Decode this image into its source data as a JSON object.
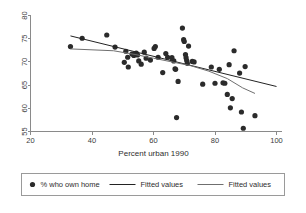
{
  "chart_data": {
    "type": "scatter",
    "title": "",
    "xlabel": "Percent urban 1990",
    "ylabel": "",
    "xlim": [
      20,
      100
    ],
    "ylim": [
      55,
      80
    ],
    "xticks": [
      20,
      40,
      60,
      80,
      100
    ],
    "yticks": [
      55,
      60,
      65,
      70,
      75,
      80
    ],
    "grid": false,
    "legend_position": "bottom",
    "series": [
      {
        "name": "% who own home",
        "type": "scatter",
        "marker": "filled-circle",
        "color": "#2b2b2b",
        "points": [
          [
            33.0,
            73.3
          ],
          [
            36.8,
            75.1
          ],
          [
            44.8,
            75.8
          ],
          [
            47.5,
            73.2
          ],
          [
            50.5,
            69.9
          ],
          [
            51.0,
            72.3
          ],
          [
            51.6,
            71.0
          ],
          [
            51.8,
            68.9
          ],
          [
            53.0,
            71.7
          ],
          [
            53.6,
            71.4
          ],
          [
            54.0,
            71.8
          ],
          [
            54.4,
            71.9
          ],
          [
            54.8,
            71.5
          ],
          [
            55.2,
            70.2
          ],
          [
            56.0,
            69.5
          ],
          [
            57.0,
            72.1
          ],
          [
            57.6,
            70.8
          ],
          [
            59.0,
            70.4
          ],
          [
            60.2,
            72.9
          ],
          [
            60.6,
            73.3
          ],
          [
            61.5,
            71.0
          ],
          [
            63.0,
            67.7
          ],
          [
            64.0,
            71.8
          ],
          [
            64.6,
            71.0
          ],
          [
            66.0,
            70.9
          ],
          [
            66.6,
            70.2
          ],
          [
            67.0,
            68.5
          ],
          [
            67.2,
            68.4
          ],
          [
            67.5,
            58.0
          ],
          [
            68.0,
            65.8
          ],
          [
            69.4,
            77.3
          ],
          [
            69.8,
            74.8
          ],
          [
            70.0,
            74.4
          ],
          [
            70.4,
            71.6
          ],
          [
            70.6,
            70.9
          ],
          [
            70.8,
            70.3
          ],
          [
            71.0,
            69.7
          ],
          [
            71.4,
            73.4
          ],
          [
            72.6,
            70.1
          ],
          [
            73.2,
            70.0
          ],
          [
            76.0,
            65.2
          ],
          [
            78.8,
            68.9
          ],
          [
            80.0,
            65.4
          ],
          [
            81.4,
            68.4
          ],
          [
            82.6,
            65.5
          ],
          [
            83.2,
            65.4
          ],
          [
            84.0,
            63.0
          ],
          [
            84.6,
            69.4
          ],
          [
            85.0,
            60.1
          ],
          [
            85.6,
            62.1
          ],
          [
            86.2,
            72.4
          ],
          [
            88.0,
            67.6
          ],
          [
            88.6,
            59.2
          ],
          [
            89.2,
            55.7
          ],
          [
            89.8,
            69.0
          ],
          [
            93.0,
            58.4
          ]
        ]
      },
      {
        "name": "Fitted values",
        "type": "line",
        "style": "linear",
        "color": "#232323",
        "points": [
          [
            33.0,
            75.6
          ],
          [
            100.0,
            64.7
          ]
        ]
      },
      {
        "name": "Fitted values",
        "type": "line",
        "style": "lowess",
        "color": "#6f6f6f",
        "points": [
          [
            33.0,
            72.8
          ],
          [
            40.0,
            72.6
          ],
          [
            47.0,
            72.4
          ],
          [
            54.0,
            71.6
          ],
          [
            60.0,
            70.8
          ],
          [
            66.0,
            70.0
          ],
          [
            72.0,
            69.2
          ],
          [
            78.0,
            68.0
          ],
          [
            84.0,
            66.4
          ],
          [
            89.0,
            64.4
          ],
          [
            93.0,
            63.2
          ]
        ]
      }
    ]
  },
  "legend": {
    "entries": [
      {
        "label": "% who own home",
        "kind": "marker"
      },
      {
        "label": "Fitted values",
        "kind": "line-dark"
      },
      {
        "label": "Fitted values",
        "kind": "line-light"
      }
    ]
  }
}
